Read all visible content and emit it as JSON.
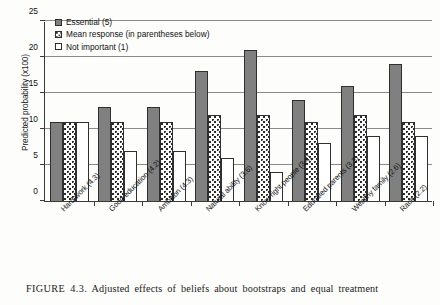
{
  "figure": {
    "caption_prefix": "FIGURE 4.3.",
    "caption_text": "Adjusted effects of beliefs about bootstraps and equal treatment"
  },
  "chart_data": {
    "type": "bar",
    "title": "",
    "xlabel": "",
    "ylabel": "Predicted probability (x100)",
    "ylim": [
      0,
      25
    ],
    "yticks": [
      0,
      5,
      10,
      15,
      20,
      25
    ],
    "grid": true,
    "legend_position": "top-left",
    "categories": [
      "Hard work (4.3)",
      "Good education (4.2)",
      "Ambition (4.3)",
      "Natural ability (3.6)",
      "Know right people (3.4)",
      "Educated parents (3.3)",
      "Wealthy family (2.6)",
      "Race (2.2)"
    ],
    "series": [
      {
        "name": "Essential (5)",
        "pattern": "solid-gray",
        "color": "#808080",
        "values": [
          11,
          13,
          13,
          18,
          21,
          14,
          16,
          19
        ]
      },
      {
        "name": "Mean response (in parentheses below)",
        "pattern": "dotted",
        "color": "#ffffff",
        "values": [
          11,
          11,
          11,
          12,
          12,
          11,
          12,
          11
        ]
      },
      {
        "name": "Not important (1)",
        "pattern": "white",
        "color": "#ffffff",
        "values": [
          11,
          7,
          7,
          6,
          4,
          8,
          9,
          9
        ]
      }
    ]
  }
}
